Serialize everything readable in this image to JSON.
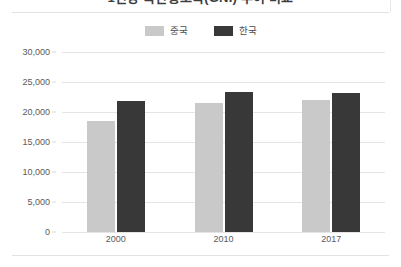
{
  "chart_data": {
    "type": "bar",
    "title": "1인당 국민총소득(GNI) 추이 비교",
    "categories": [
      "2000",
      "2010",
      "2017"
    ],
    "series": [
      {
        "name": "중국",
        "color": "#c9c9c9",
        "values": [
          18500,
          21500,
          22000
        ]
      },
      {
        "name": "한국",
        "color": "#383838",
        "values": [
          21900,
          23300,
          23100
        ]
      }
    ],
    "xlabel": "",
    "ylabel": "",
    "ylim": [
      0,
      30000
    ],
    "ytick_labels": [
      "30,000",
      "25,000",
      "20,000",
      "15,000",
      "10,000",
      "5,000",
      "0"
    ],
    "ytick_values": [
      30000,
      25000,
      20000,
      15000,
      10000,
      5000,
      0
    ],
    "grid": true,
    "legend_position": "top-center"
  }
}
